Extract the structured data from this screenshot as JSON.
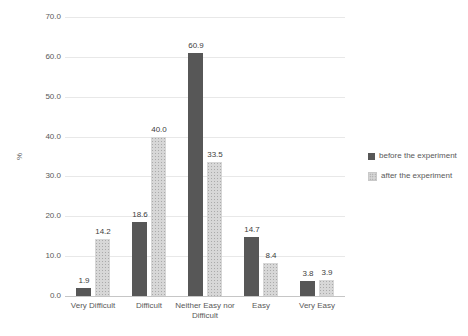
{
  "chart_data": {
    "type": "bar",
    "title": "",
    "categories": [
      "Very Difficult",
      "Difficult",
      "Neither Easy nor Difficult",
      "Easy",
      "Very Easy"
    ],
    "series": [
      {
        "name": "before the experiment",
        "values": [
          1.9,
          18.6,
          60.9,
          14.7,
          3.8
        ],
        "color": "#575757",
        "pattern": "solid"
      },
      {
        "name": "after the experiment",
        "values": [
          14.2,
          40.0,
          33.5,
          8.4,
          3.9
        ],
        "color": "#d7d7d7",
        "pattern": "dots"
      }
    ],
    "value_labels": [
      [
        "1.9",
        "18.6",
        "60.9",
        "14.7",
        "3.8"
      ],
      [
        "14.2",
        "40.0",
        "33.5",
        "8.4",
        "3.9"
      ]
    ],
    "xlabel": "",
    "ylabel": "%",
    "ylim": [
      0,
      70
    ],
    "ytick_step": 10,
    "ytick_labels": [
      "0.0",
      "10.0",
      "20.0",
      "30.0",
      "40.0",
      "50.0",
      "60.0",
      "70.0"
    ],
    "grid": true,
    "legend_position": "right",
    "colors": {
      "bar_before": "#575757",
      "bar_after": "#d7d7d7",
      "gridline": "#e8e8e8",
      "axis_line": "#c6c6c6",
      "text": "#595959"
    }
  }
}
